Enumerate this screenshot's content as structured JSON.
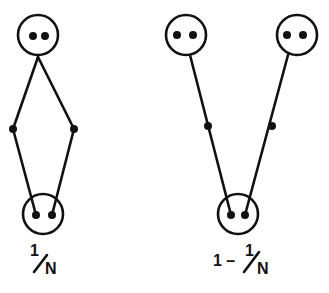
{
  "colors": {
    "ink": "#111111",
    "background": "#ffffff"
  },
  "diagrams": [
    {
      "name": "left-diagram",
      "label": {
        "numerator": "1",
        "denominator": "N"
      },
      "top_circles": [
        {
          "cx": 38,
          "cy": 35
        }
      ],
      "bottom_circle": {
        "cx": 43,
        "cy": 214
      },
      "junctions": [
        {
          "x": 13,
          "y": 129
        },
        {
          "x": 74,
          "y": 129
        }
      ]
    },
    {
      "name": "right-diagram",
      "label": {
        "prefix": "1 –",
        "numerator": "1",
        "denominator": "N"
      },
      "top_circles": [
        {
          "cx": 186,
          "cy": 35
        },
        {
          "cx": 297,
          "cy": 35
        }
      ],
      "bottom_circle": {
        "cx": 238,
        "cy": 214
      },
      "junctions": [
        {
          "x": 208,
          "y": 126
        },
        {
          "x": 272,
          "y": 126
        }
      ]
    }
  ]
}
